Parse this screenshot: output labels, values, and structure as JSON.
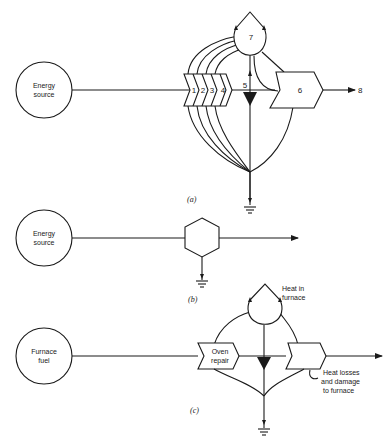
{
  "diagram_a": {
    "caption": "(a)",
    "source_label_line1": "Energy",
    "source_label_line2": "source",
    "stage_labels": [
      "1",
      "2",
      "3",
      "4"
    ],
    "switch_label": "5",
    "output_block_label": "6",
    "storage_label": "7",
    "output_label": "8"
  },
  "diagram_b": {
    "caption": "(b)",
    "source_label_line1": "Energy",
    "source_label_line2": "source"
  },
  "diagram_c": {
    "caption": "(c)",
    "source_label_line1": "Furnace",
    "source_label_line2": "fuel",
    "interaction_label_line1": "Oven",
    "interaction_label_line2": "repair",
    "storage_label_line1": "Heat in",
    "storage_label_line2": "furnace",
    "loss_label_line1": "Heat losses",
    "loss_label_line2": "and damage",
    "loss_label_line3": "to furnace"
  },
  "colors": {
    "ink": "#1a1a1a",
    "background": "#ffffff"
  }
}
